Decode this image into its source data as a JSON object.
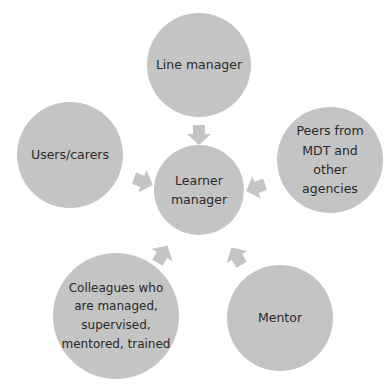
{
  "diagram": {
    "type": "hub-and-spoke",
    "center": {
      "label": "Learner manager"
    },
    "nodes": [
      {
        "id": "line-manager",
        "label": "Line manager"
      },
      {
        "id": "users-carers",
        "label": "Users/carers"
      },
      {
        "id": "peers",
        "label": "Peers from MDT and other agencies"
      },
      {
        "id": "colleagues",
        "label": "Colleagues who are managed, supervised, mentored, trained"
      },
      {
        "id": "mentor",
        "label": "Mentor"
      }
    ],
    "edges": [
      {
        "from": "line-manager",
        "to": "center"
      },
      {
        "from": "users-carers",
        "to": "center"
      },
      {
        "from": "peers",
        "to": "center"
      },
      {
        "from": "colleagues",
        "to": "center"
      },
      {
        "from": "mentor",
        "to": "center"
      }
    ],
    "colors": {
      "node_fill": "#c4c4c4",
      "arrow_fill": "#c4c4c4",
      "text": "#2a2a2a"
    }
  }
}
